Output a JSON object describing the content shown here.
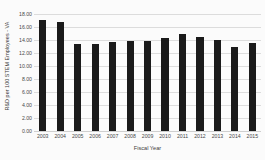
{
  "chart_data": {
    "type": "bar",
    "title": "",
    "xlabel": "Fiscal Year",
    "ylabel": "R&D per 100 STEM Employees - VA",
    "categories": [
      "2003",
      "2004",
      "2005",
      "2006",
      "2007",
      "2008",
      "2009",
      "2010",
      "2011",
      "2012",
      "2013",
      "2014",
      "2015"
    ],
    "values": [
      17.1,
      16.7,
      13.4,
      13.45,
      13.7,
      13.8,
      13.8,
      14.25,
      15.0,
      14.5,
      14.05,
      13.0,
      13.5
    ],
    "ylim": [
      0,
      18
    ],
    "ytick_values": [
      18,
      16,
      14,
      12,
      10,
      8,
      6,
      4,
      2,
      0
    ],
    "ytick_labels": [
      "18.00",
      "16.00",
      "14.00",
      "12.00",
      "10.00",
      "8.00",
      "6.00",
      "4.00",
      "2.00",
      "0.00"
    ],
    "grid": true,
    "grid_axis": "y",
    "legend": false,
    "legend_position": "none",
    "bar_color": "#1a1a1a",
    "gridline_color": "#dcdcdc",
    "background_color": "#fbfbfb"
  }
}
